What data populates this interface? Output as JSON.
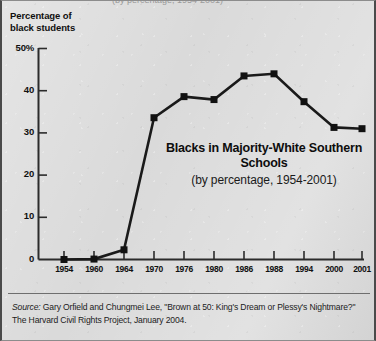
{
  "figure": {
    "top_cropped_text": "(by percentage, 1954-2001)",
    "axis_title_line1": "Percentage of",
    "axis_title_line2": "black students",
    "source_label": "Source:",
    "source_text": " Gary Orfield and Chungmei Lee, \"Brown at 50: King's Dream or Plessy's Nightmare?\" The Harvard Civil Rights Project, January 2004."
  },
  "chart_data": {
    "type": "line",
    "title": "Blacks in Majority-White Southern Schools",
    "subtitle": "(by percentage, 1954-2001)",
    "xlabel": "",
    "ylabel": "Percentage of black students",
    "categories": [
      "1954",
      "1960",
      "1964",
      "1970",
      "1976",
      "1980",
      "1986",
      "1988",
      "1994",
      "2000",
      "2001"
    ],
    "values": [
      0.0,
      0.1,
      2.3,
      33.6,
      38.6,
      37.9,
      43.5,
      44.0,
      37.4,
      31.3,
      31.0
    ],
    "ylim": [
      0,
      50
    ],
    "ytick_labels": [
      "50%",
      "40",
      "30",
      "20",
      "10",
      "0"
    ],
    "ytick_values": [
      50,
      40,
      30,
      20,
      10,
      0
    ],
    "grid": false,
    "legend": "none",
    "marker": "square",
    "line_color": "#1a1a1a",
    "marker_color": "#111111",
    "background_color": "#dadada"
  }
}
